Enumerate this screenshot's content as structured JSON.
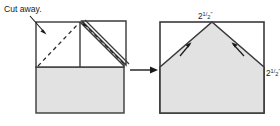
{
  "diagram": {
    "background_color": "#ffffff",
    "outline_color": "#3a3a3a",
    "fill_color": "#e2e2e2",
    "dash_color": "#2b2b2b",
    "labels": {
      "cut_away": "Cut away.",
      "top_measure": "2½\"",
      "right_measure": "2½\"",
      "top_measure_whole": "2",
      "top_measure_frac_num": "1",
      "top_measure_frac_den": "2",
      "top_measure_unit": "\"",
      "right_measure_whole": "2",
      "right_measure_frac_num": "1",
      "right_measure_frac_den": "2",
      "right_measure_unit": "\""
    },
    "left_figure": {
      "name": "folded-paper-before-cut",
      "square": {
        "x": 36,
        "y": 22,
        "width": 88,
        "height": 91
      },
      "horizontal_fold_y": 67,
      "vertical_fold_x": 80,
      "flap": {
        "description": "folded triangular flap lifted to the right",
        "points": "80,22 124,22 124,66 80,22"
      }
    },
    "right_figure": {
      "name": "cut-paper-result",
      "square": {
        "x": 160,
        "y": 22,
        "width": 104,
        "height": 91
      },
      "pentagon_points": "160,113 264,113 264,67 212,22 160,67",
      "apex": {
        "x": 212,
        "y": 22
      }
    },
    "process_arrow": {
      "name": "process-arrow",
      "from_x": 130,
      "to_x": 158,
      "y": 70
    }
  }
}
